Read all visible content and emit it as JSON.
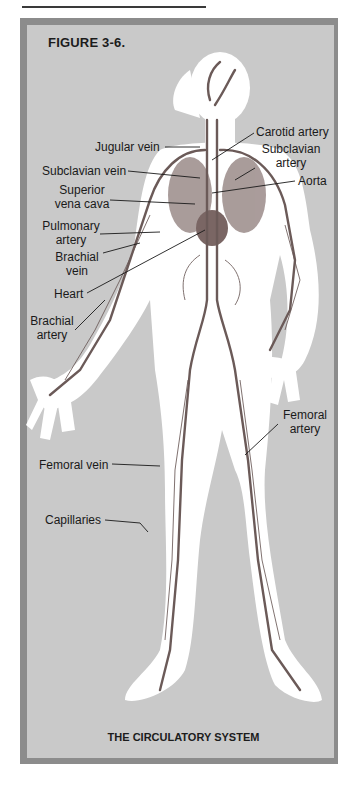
{
  "figure": {
    "title": "FIGURE 3-6.",
    "caption": "THE CIRCULATORY SYSTEM"
  },
  "labels": {
    "carotid_artery": "Carotid  artery",
    "jugular_vein": "Jugular vein",
    "subclavian_artery_1": "Subclavian",
    "subclavian_artery_2": "artery",
    "subclavian_vein": "Subclavian vein",
    "aorta": "Aorta",
    "superior_vena_cava_1": "Superior",
    "superior_vena_cava_2": "vena cava",
    "pulmonary_artery_1": "Pulmonary",
    "pulmonary_artery_2": "artery",
    "brachial_vein_1": "Brachial",
    "brachial_vein_2": "vein",
    "heart": "Heart",
    "brachial_artery_1": "Brachial",
    "brachial_artery_2": "artery",
    "femoral_artery_1": "Femoral",
    "femoral_artery_2": "artery",
    "femoral_vein": "Femoral vein",
    "capillaries": "Capillaries"
  },
  "colors": {
    "frame": "#8c8c8c",
    "panel": "#c9c9c9",
    "body_halo": "#ffffff",
    "vessel": "#6b5a58"
  }
}
